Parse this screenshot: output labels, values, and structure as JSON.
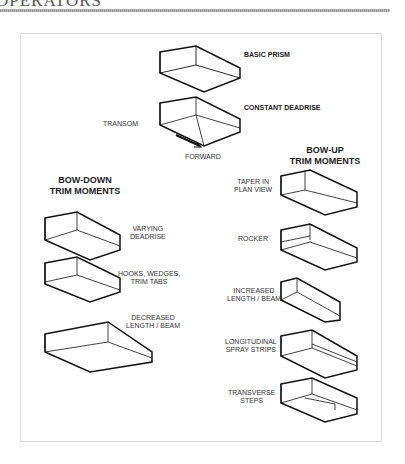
{
  "header": {
    "title": "OPERATORS"
  },
  "diagram": {
    "basic_prism": "BASIC PRISM",
    "constant_deadrise": "CONSTANT DEADRISE",
    "transom": "TRANSOM",
    "beta": "β",
    "forward": "FORWARD",
    "bow_down": {
      "title_line1": "BOW-DOWN",
      "title_line2": "TRIM MOMENTS",
      "items": [
        {
          "line1": "VARYING",
          "line2": "DEADRISE",
          "beta1": "β1",
          "beta2": "β2"
        },
        {
          "line1": "HOOKS, WEDGES,",
          "line2": "TRIM TABS"
        },
        {
          "line1": "DECREASED",
          "line2": "LENGTH / BEAM"
        }
      ]
    },
    "bow_up": {
      "title_line1": "BOW-UP",
      "title_line2": "TRIM MOMENTS",
      "items": [
        {
          "line1": "TAPER IN",
          "line2": "PLAN VIEW"
        },
        {
          "line1": "ROCKER",
          "line2": ""
        },
        {
          "line1": "INCREASED",
          "line2": "LENGTH / BEAM"
        },
        {
          "line1": "LONGITUDINAL",
          "line2": "SPRAY STRIPS"
        },
        {
          "line1": "TRANSVERSE",
          "line2": "STEPS"
        }
      ]
    },
    "centerline_symbol": "℄"
  }
}
